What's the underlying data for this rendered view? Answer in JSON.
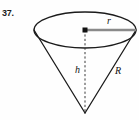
{
  "figure": {
    "problem_number": "37.",
    "kind": "geometry-diagram",
    "shape": "inverted-cone",
    "background_color": "#fefefe",
    "stroke_color": "#1b1b1b",
    "radius_line_color": "#7d7d7d",
    "labels": {
      "radius": "r",
      "height": "h",
      "slant": "R"
    },
    "geometry": {
      "ellipse_center": [
        85,
        30
      ],
      "ellipse_rx": 51,
      "ellipse_ry": 18,
      "apex": [
        85,
        113
      ],
      "radius_line_from": [
        85,
        30
      ],
      "radius_line_to": [
        136,
        30
      ],
      "height_line_from": [
        85,
        30
      ],
      "height_line_to": [
        85,
        113
      ],
      "left_slant_from": [
        34,
        30
      ],
      "right_slant_from": [
        136,
        30
      ]
    }
  }
}
